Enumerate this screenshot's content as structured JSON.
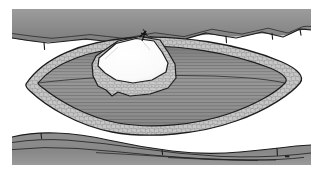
{
  "figure": {
    "title": "Open elliptical surgical incision with retracted wound edges",
    "type": "medical-illustration",
    "style": "grayscale line drawing with stipple and striation shading",
    "width": 323,
    "height": 172,
    "background_color": "#ffffff"
  },
  "palette": {
    "background": "#ffffff",
    "skin_band": "#8d8d8d",
    "skin_band_light": "#a2a2a2",
    "skin_band_dark": "#6f6f6f",
    "outline": "#1d1d1d",
    "fat_fill": "#c2c2c2",
    "fat_stipple": "#8e8e8e",
    "muscle_fill": "#9a9a9a",
    "muscle_stripe": "#6b6b6b",
    "muscle_deep": "#808080",
    "lesion_white": "#fbfbfb",
    "lesion_edge": "#a8a8a8",
    "suture_black": "#141414"
  },
  "regions": [
    {
      "id": "skin-band-top",
      "label": "Upper skin and subcutaneous band",
      "description": "Horizontal gray tissue band across the top of the frame with a wavy lower margin",
      "fill": "#8d8d8d",
      "hair_marks": 6
    },
    {
      "id": "skin-band-bottom",
      "label": "Lower skin and subcutaneous band",
      "description": "Horizontal gray tissue band across the bottom of the frame with thin dark fascial lines",
      "fill": "#8d8d8d",
      "fascial_lines": 4
    },
    {
      "id": "wound-ellipse",
      "label": "Retracted elliptical wound opening",
      "description": "Large lens-shaped opening occupying the centre of the field",
      "apex_left_x": 26,
      "apex_right_x": 300
    },
    {
      "id": "fat-layer",
      "label": "Subcutaneous fat layer",
      "description": "Cobblestone-stippled band lining the inner rim of the wound",
      "fill": "#c2c2c2",
      "texture": "stipple"
    },
    {
      "id": "muscle-upper",
      "label": "Upper muscle belly",
      "description": "Horizontally striated muscle along the superior wound floor",
      "fill": "#9a9a9a",
      "texture": "striation"
    },
    {
      "id": "muscle-lower",
      "label": "Lower muscle belly",
      "description": "Horizontally striated muscle along the inferior wound floor",
      "fill": "#9a9a9a",
      "texture": "striation"
    },
    {
      "id": "lesion-graft",
      "label": "Exposed bone graft / lesion",
      "description": "Irregular polygonal white mass centred on the wound with a stippled inferior collar",
      "fill": "#fbfbfb"
    },
    {
      "id": "marker-suture",
      "label": "Marker suture",
      "description": "Short dark knotted stitch at the superior margin of the white mass",
      "color": "#141414"
    }
  ],
  "annotations": {
    "labels": [],
    "leader_lines": 0,
    "caption": ""
  }
}
